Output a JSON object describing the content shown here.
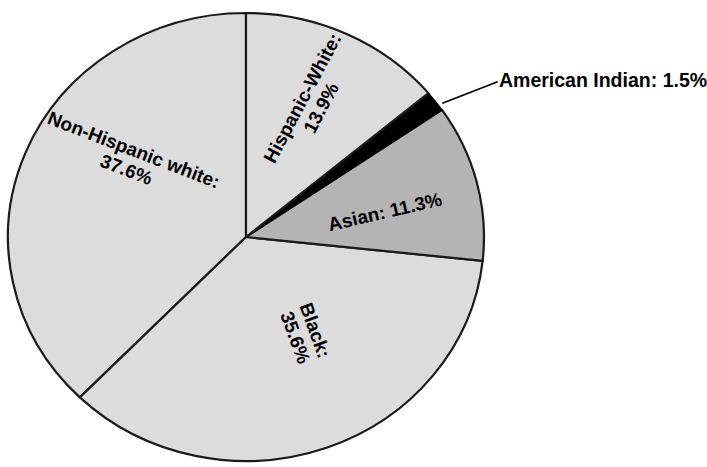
{
  "chart_data": {
    "type": "pie",
    "title": "",
    "subtitle": "",
    "xlabel": "",
    "ylabel": "",
    "legend_position": "none",
    "grid": false,
    "units": "percent",
    "start_angle_deg": 0,
    "direction": "clockwise",
    "categories": [
      "Hispanic-White",
      "American Indian",
      "Asian",
      "Black",
      "Non-Hispanic white"
    ],
    "values": [
      13.9,
      1.5,
      11.3,
      35.6,
      37.6
    ],
    "colors": [
      "#dcdcdc",
      "#000000",
      "#b4b4b4",
      "#dcdcdc",
      "#dcdcdc"
    ],
    "slices": [
      {
        "name": "Hispanic-White",
        "label": "Hispanic-White:",
        "value_label": "13.9%",
        "value": 13.9,
        "color": "#dcdcdc",
        "start_deg": 0.0,
        "end_deg": 50.04,
        "label_placement": "inside",
        "label_rotation_deg": -62
      },
      {
        "name": "American Indian",
        "label": "American Indian:",
        "value_label": "1.5%",
        "value": 1.5,
        "color": "#000000",
        "start_deg": 50.04,
        "end_deg": 55.44,
        "label_placement": "callout",
        "label_rotation_deg": 0
      },
      {
        "name": "Asian",
        "label": "Asian:",
        "value_label": "11.3%",
        "value": 11.3,
        "color": "#b4b4b4",
        "start_deg": 55.44,
        "end_deg": 96.12,
        "label_placement": "inside",
        "label_rotation_deg": -13
      },
      {
        "name": "Black",
        "label": "Black:",
        "value_label": "35.6%",
        "value": 35.6,
        "color": "#dcdcdc",
        "start_deg": 96.12,
        "end_deg": 224.28,
        "label_placement": "inside",
        "label_rotation_deg": 70
      },
      {
        "name": "Non-Hispanic white",
        "label": "Non-Hispanic white:",
        "value_label": "37.6%",
        "value": 37.6,
        "color": "#dcdcdc",
        "start_deg": 224.28,
        "end_deg": 360.0,
        "label_placement": "inside",
        "label_rotation_deg": 21
      }
    ]
  },
  "labels": {
    "hispanic_white": {
      "name": "Hispanic-White:",
      "percent": "13.9%"
    },
    "american_indian": {
      "name": "American Indian:",
      "percent": "1.5%"
    },
    "asian": {
      "name": "Asian:",
      "percent": "11.3%"
    },
    "black": {
      "name": "Black:",
      "percent": "35.6%"
    },
    "non_hispanic_white": {
      "name": "Non-Hispanic white:",
      "percent": "37.6%"
    },
    "asian_combined": "Asian:  11.3%"
  },
  "style": {
    "slice_fill_light": "#dcdcdc",
    "slice_fill_medium": "#b4b4b4",
    "slice_fill_dark": "#000000",
    "outline": "#1a1a1a",
    "background": "#ffffff",
    "text_color": "#000000"
  },
  "geometry": {
    "center_x": 246,
    "center_y": 237,
    "radius_x": 238,
    "radius_y": 224
  }
}
